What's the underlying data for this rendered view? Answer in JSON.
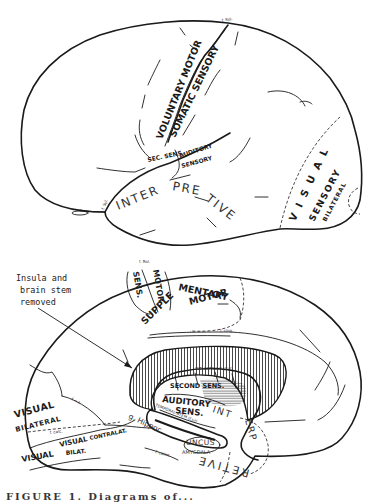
{
  "figure": {
    "lateral_view": {
      "labels": {
        "voluntary_motor": "VOLUNTARY MOTOR",
        "somatic_sensory": "SOMATIC SENSORY",
        "sec_sens": "SEC. SENS.",
        "auditory": "AUDITORY",
        "sensory": "SENSORY",
        "interpretive": "INTERPRETIVE",
        "visual": "V I S U A L",
        "visual_sensory": "SENSORY",
        "bilateral": "BILATERAL",
        "f_rol": "f. Rol.",
        "f_syl": "f. Syl."
      }
    },
    "medial_view": {
      "annotation": {
        "line1": "Insula and",
        "line2": "brain stem",
        "line3": "removed"
      },
      "labels": {
        "f_rol": "f. Rol.",
        "sens": "SENS.",
        "motor": "MOTOR",
        "supplementary": "SUPPLEMENTARY",
        "supp_motor": "MOTOR",
        "f_cing": "f. cing.",
        "second_sens": "SECOND SENS.",
        "auditory": "AUDITORY",
        "sens2": "SENS.",
        "int": "INT",
        "erp": "ERP",
        "retive": "RETIVE",
        "temporal_stem": "TEMPORAL STEM (Cut)",
        "int_capsule": "INT. CAPSULE (Cut)",
        "visual_bilateral_1": "VISUAL",
        "visual_bilateral_2": "BILATERAL",
        "f_cs": "f. c.s.",
        "f_calc": "f. calc.",
        "visual_contralat": "VISUAL CONTRALAT.",
        "visual_bilat": "VISUAL BILAT.",
        "hippoc": "g. Hippoc.",
        "uncus": "UNCUS",
        "amygdala": "AMYGDALA",
        "f_collat": "f. collat."
      }
    },
    "caption": "FIGURE 1. Diagrams of..."
  },
  "colors": {
    "ink": "#1a1a1a",
    "paper": "#ffffff"
  }
}
